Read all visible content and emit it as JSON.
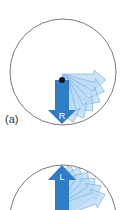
{
  "panels": [
    {
      "id": "a",
      "caption": "(a)",
      "arrow_letter": "R",
      "arrow_direction": "down",
      "fan_direction": "clockwise-toward-right"
    },
    {
      "id": "b",
      "caption": "",
      "arrow_letter": "L",
      "arrow_direction": "up",
      "fan_direction": "toward-right"
    }
  ],
  "colors": {
    "primary_arrow": "#2e7dc6",
    "fan_arrow_fill": "#b9d9f5",
    "fan_arrow_stroke": "#5a9ad6",
    "circle_stroke": "#555555",
    "pivot_dot": "#111111"
  }
}
